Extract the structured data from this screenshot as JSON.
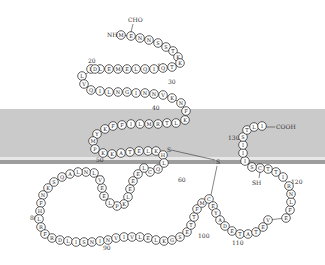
{
  "diagram": {
    "type": "membrane protein topology",
    "membrane": {
      "top": 109,
      "bottom": 160,
      "color": "#c9c9c9",
      "stripe_color": "#9a9a9a"
    },
    "terminals": {
      "n_term": "NH",
      "n_mod": "CHO",
      "c_term": "COOH"
    },
    "disulfide": {
      "s1": "S",
      "s2": "S"
    },
    "sh_label": "SH",
    "position_labels": [
      {
        "text": "10",
        "x": 157,
        "y": 68
      },
      {
        "text": "20",
        "x": 88,
        "y": 63
      },
      {
        "text": "30",
        "x": 168,
        "y": 84
      },
      {
        "text": "40",
        "x": 152,
        "y": 110
      },
      {
        "text": "50",
        "x": 96,
        "y": 162
      },
      {
        "text": "60",
        "x": 178,
        "y": 182
      },
      {
        "text": "70",
        "x": 96,
        "y": 180
      },
      {
        "text": "80",
        "x": 30,
        "y": 220
      },
      {
        "text": "90",
        "x": 103,
        "y": 250
      },
      {
        "text": "100",
        "x": 198,
        "y": 238
      },
      {
        "text": "110",
        "x": 232,
        "y": 245
      },
      {
        "text": "120",
        "x": 291,
        "y": 184
      },
      {
        "text": "130",
        "x": 228,
        "y": 140
      }
    ],
    "residues": [
      {
        "aa": "M",
        "x": 121,
        "y": 35
      },
      {
        "aa": "E",
        "x": 131,
        "y": 36
      },
      {
        "aa": "N",
        "x": 140,
        "y": 38
      },
      {
        "aa": "N",
        "x": 149,
        "y": 40
      },
      {
        "aa": "S",
        "x": 158,
        "y": 43
      },
      {
        "aa": "S",
        "x": 166,
        "y": 47
      },
      {
        "aa": "T",
        "x": 173,
        "y": 51
      },
      {
        "aa": "K",
        "x": 178,
        "y": 57
      },
      {
        "aa": "K",
        "x": 180,
        "y": 63
      },
      {
        "aa": "T",
        "x": 172,
        "y": 67
      },
      {
        "aa": "Q",
        "x": 163,
        "y": 68
      },
      {
        "aa": "I",
        "x": 154,
        "y": 69
      },
      {
        "aa": "Q",
        "x": 145,
        "y": 69
      },
      {
        "aa": "L",
        "x": 136,
        "y": 69
      },
      {
        "aa": "E",
        "x": 127,
        "y": 69
      },
      {
        "aa": "M",
        "x": 118,
        "y": 69
      },
      {
        "aa": "E",
        "x": 109,
        "y": 69
      },
      {
        "aa": "L",
        "x": 100,
        "y": 69
      },
      {
        "aa": "L",
        "x": 91,
        "y": 69
      },
      {
        "aa": "D",
        "x": 95,
        "y": 69
      },
      {
        "aa": "L",
        "x": 82,
        "y": 76
      },
      {
        "aa": "V",
        "x": 84,
        "y": 84
      },
      {
        "aa": "Q",
        "x": 91,
        "y": 90
      },
      {
        "aa": "I",
        "x": 100,
        "y": 91
      },
      {
        "aa": "L",
        "x": 109,
        "y": 92
      },
      {
        "aa": "N",
        "x": 118,
        "y": 92
      },
      {
        "aa": "G",
        "x": 127,
        "y": 92
      },
      {
        "aa": "I",
        "x": 136,
        "y": 93
      },
      {
        "aa": "N",
        "x": 145,
        "y": 93
      },
      {
        "aa": "N",
        "x": 154,
        "y": 94
      },
      {
        "aa": "V",
        "x": 163,
        "y": 95
      },
      {
        "aa": "K",
        "x": 172,
        "y": 98
      },
      {
        "aa": "N",
        "x": 181,
        "y": 103
      },
      {
        "aa": "F",
        "x": 186,
        "y": 111
      },
      {
        "aa": "K",
        "x": 185,
        "y": 120
      },
      {
        "aa": "L",
        "x": 176,
        "y": 123
      },
      {
        "aa": "T",
        "x": 167,
        "y": 123
      },
      {
        "aa": "R",
        "x": 158,
        "y": 124
      },
      {
        "aa": "M",
        "x": 149,
        "y": 124
      },
      {
        "aa": "L",
        "x": 140,
        "y": 124
      },
      {
        "aa": "I",
        "x": 131,
        "y": 124
      },
      {
        "aa": "F",
        "x": 122,
        "y": 125
      },
      {
        "aa": "F",
        "x": 113,
        "y": 126
      },
      {
        "aa": "K",
        "x": 105,
        "y": 129
      },
      {
        "aa": "Y",
        "x": 97,
        "y": 134
      },
      {
        "aa": "M",
        "x": 93,
        "y": 141
      },
      {
        "aa": "P",
        "x": 95,
        "y": 149
      },
      {
        "aa": "K",
        "x": 103,
        "y": 153
      },
      {
        "aa": "K",
        "x": 112,
        "y": 154
      },
      {
        "aa": "A",
        "x": 121,
        "y": 153
      },
      {
        "aa": "T",
        "x": 130,
        "y": 152
      },
      {
        "aa": "E",
        "x": 139,
        "y": 151
      },
      {
        "aa": "L",
        "x": 148,
        "y": 151
      },
      {
        "aa": "K",
        "x": 156,
        "y": 151
      },
      {
        "aa": "H",
        "x": 163,
        "y": 155
      },
      {
        "aa": "L",
        "x": 164,
        "y": 163
      },
      {
        "aa": "Q",
        "x": 158,
        "y": 169
      },
      {
        "aa": "C",
        "x": 150,
        "y": 172
      },
      {
        "aa": "L",
        "x": 144,
        "y": 168
      },
      {
        "aa": "E",
        "x": 138,
        "y": 174
      },
      {
        "aa": "E",
        "x": 133,
        "y": 181
      },
      {
        "aa": "E",
        "x": 130,
        "y": 189
      },
      {
        "aa": "L",
        "x": 128,
        "y": 197
      },
      {
        "aa": "K",
        "x": 124,
        "y": 204
      },
      {
        "aa": "P",
        "x": 117,
        "y": 206
      },
      {
        "aa": "L",
        "x": 110,
        "y": 203
      },
      {
        "aa": "E",
        "x": 104,
        "y": 196
      },
      {
        "aa": "E",
        "x": 102,
        "y": 188
      },
      {
        "aa": "V",
        "x": 100,
        "y": 180
      },
      {
        "aa": "L",
        "x": 94,
        "y": 173
      },
      {
        "aa": "N",
        "x": 86,
        "y": 172
      },
      {
        "aa": "L",
        "x": 78,
        "y": 172
      },
      {
        "aa": "A",
        "x": 70,
        "y": 174
      },
      {
        "aa": "Q",
        "x": 62,
        "y": 177
      },
      {
        "aa": "S",
        "x": 54,
        "y": 182
      },
      {
        "aa": "K",
        "x": 48,
        "y": 188
      },
      {
        "aa": "N",
        "x": 43,
        "y": 195
      },
      {
        "aa": "F",
        "x": 41,
        "y": 203
      },
      {
        "aa": "H",
        "x": 40,
        "y": 211
      },
      {
        "aa": "L",
        "x": 39,
        "y": 219
      },
      {
        "aa": "R",
        "x": 41,
        "y": 227
      },
      {
        "aa": "F",
        "x": 45,
        "y": 234
      },
      {
        "aa": "R",
        "x": 52,
        "y": 238
      },
      {
        "aa": "D",
        "x": 60,
        "y": 240
      },
      {
        "aa": "L",
        "x": 68,
        "y": 241
      },
      {
        "aa": "I",
        "x": 76,
        "y": 242
      },
      {
        "aa": "S",
        "x": 84,
        "y": 242
      },
      {
        "aa": "N",
        "x": 92,
        "y": 242
      },
      {
        "aa": "I",
        "x": 100,
        "y": 241
      },
      {
        "aa": "N",
        "x": 108,
        "y": 240
      },
      {
        "aa": "V",
        "x": 116,
        "y": 238
      },
      {
        "aa": "I",
        "x": 124,
        "y": 237
      },
      {
        "aa": "V",
        "x": 132,
        "y": 237
      },
      {
        "aa": "L",
        "x": 140,
        "y": 237
      },
      {
        "aa": "E",
        "x": 148,
        "y": 238
      },
      {
        "aa": "L",
        "x": 156,
        "y": 240
      },
      {
        "aa": "K",
        "x": 164,
        "y": 241
      },
      {
        "aa": "G",
        "x": 172,
        "y": 240
      },
      {
        "aa": "S",
        "x": 180,
        "y": 237
      },
      {
        "aa": "E",
        "x": 187,
        "y": 232
      },
      {
        "aa": "T",
        "x": 191,
        "y": 225
      },
      {
        "aa": "T",
        "x": 194,
        "y": 217
      },
      {
        "aa": "F",
        "x": 197,
        "y": 209
      },
      {
        "aa": "M",
        "x": 202,
        "y": 203
      },
      {
        "aa": "C",
        "x": 209,
        "y": 199
      },
      {
        "aa": "E",
        "x": 213,
        "y": 206
      },
      {
        "aa": "Y",
        "x": 216,
        "y": 213
      },
      {
        "aa": "A",
        "x": 220,
        "y": 220
      },
      {
        "aa": "D",
        "x": 225,
        "y": 226
      },
      {
        "aa": "E",
        "x": 232,
        "y": 231
      },
      {
        "aa": "T",
        "x": 240,
        "y": 234
      },
      {
        "aa": "A",
        "x": 248,
        "y": 234
      },
      {
        "aa": "T",
        "x": 256,
        "y": 232
      },
      {
        "aa": "E",
        "x": 263,
        "y": 227
      },
      {
        "aa": "V",
        "x": 268,
        "y": 220
      },
      {
        "aa": "E",
        "x": 286,
        "y": 218
      },
      {
        "aa": "F",
        "x": 290,
        "y": 210
      },
      {
        "aa": "L",
        "x": 291,
        "y": 202
      },
      {
        "aa": "N",
        "x": 291,
        "y": 194
      },
      {
        "aa": "R",
        "x": 289,
        "y": 186
      },
      {
        "aa": "I",
        "x": 283,
        "y": 177
      },
      {
        "aa": "T",
        "x": 276,
        "y": 172
      },
      {
        "aa": "T",
        "x": 268,
        "y": 169
      },
      {
        "aa": "C",
        "x": 260,
        "y": 168
      },
      {
        "aa": "S",
        "x": 252,
        "y": 167
      },
      {
        "aa": "I",
        "x": 245,
        "y": 161
      },
      {
        "aa": "I",
        "x": 243,
        "y": 153
      },
      {
        "aa": "I",
        "x": 243,
        "y": 145
      },
      {
        "aa": "S",
        "x": 243,
        "y": 137
      },
      {
        "aa": "T",
        "x": 247,
        "y": 130
      },
      {
        "aa": "L",
        "x": 254,
        "y": 127
      },
      {
        "aa": "I",
        "x": 262,
        "y": 126
      }
    ]
  }
}
